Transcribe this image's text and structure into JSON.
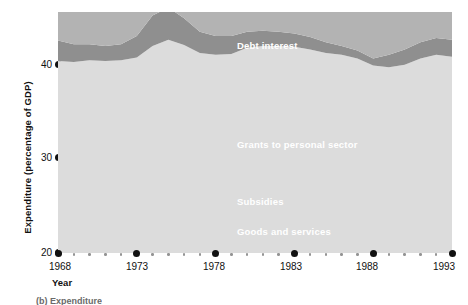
{
  "chart_data": {
    "type": "area",
    "title": "",
    "subtitle": "",
    "xlabel": "Year",
    "ylabel": "Expenditure (percentage of GDP)",
    "stacked": true,
    "grid": false,
    "legend_position": "inline-labels",
    "xlim": [
      1968,
      1993
    ],
    "ylim": [
      20,
      47
    ],
    "y_ticks": [
      20,
      30,
      40
    ],
    "x_ticks": [
      1968,
      1973,
      1978,
      1983,
      1988,
      1993
    ],
    "x": [
      1968,
      1969,
      1970,
      1971,
      1972,
      1973,
      1974,
      1975,
      1976,
      1977,
      1978,
      1979,
      1980,
      1981,
      1982,
      1983,
      1984,
      1985,
      1986,
      1987,
      1988,
      1989,
      1990,
      1991,
      1992,
      1993
    ],
    "series": [
      {
        "name": "Goods and services",
        "color": "#dcdcdc",
        "values": [
          21.5,
          21.4,
          21.6,
          21.5,
          21.6,
          21.9,
          23.2,
          23.9,
          23.3,
          22.4,
          22.2,
          22.3,
          23.0,
          23.2,
          23.2,
          23.1,
          22.8,
          22.4,
          22.2,
          21.8,
          21.0,
          20.8,
          21.1,
          21.8,
          22.2,
          22.0
        ]
      },
      {
        "name": "Subsidies",
        "color": "#8f8f8f",
        "values": [
          2.3,
          2.0,
          1.8,
          1.7,
          1.8,
          2.4,
          3.4,
          3.6,
          3.0,
          2.4,
          2.1,
          2.0,
          1.8,
          1.7,
          1.6,
          1.5,
          1.4,
          1.2,
          1.0,
          0.9,
          0.8,
          1.4,
          1.7,
          1.8,
          1.9,
          1.9
        ]
      },
      {
        "name": "Grants to personal sector",
        "color": "#b3b3b3",
        "values": [
          7.9,
          8.2,
          8.3,
          8.5,
          8.8,
          8.2,
          8.5,
          9.6,
          10.2,
          10.4,
          10.3,
          10.2,
          11.1,
          12.3,
          12.8,
          12.9,
          13.0,
          13.1,
          13.0,
          12.4,
          11.6,
          11.1,
          11.4,
          12.6,
          13.5,
          13.8
        ]
      },
      {
        "name": "Debt interest",
        "color": "#d3d3d3",
        "values": [
          3.6,
          3.6,
          3.7,
          3.6,
          3.5,
          3.6,
          4.0,
          4.4,
          4.6,
          4.4,
          4.3,
          4.4,
          4.5,
          4.8,
          4.9,
          4.7,
          4.6,
          4.4,
          4.1,
          3.7,
          3.3,
          3.1,
          3.1,
          3.2,
          3.3,
          3.4
        ]
      }
    ],
    "series_labels": [
      {
        "text": "Debt interest",
        "left": 237,
        "top": 40
      },
      {
        "text": "Grants to personal sector",
        "left": 237,
        "top": 139
      },
      {
        "text": "Subsidies",
        "left": 237,
        "top": 196
      },
      {
        "text": "Goods and services",
        "left": 237,
        "top": 226
      }
    ],
    "y_tick_labels": [
      {
        "value": "40",
        "top": 60
      },
      {
        "value": "30",
        "top": 153
      },
      {
        "value": "20",
        "top": 248
      }
    ],
    "x_tick_labels": [
      {
        "value": "1968",
        "left": 40
      },
      {
        "value": "1973",
        "left": 117
      },
      {
        "value": "1978",
        "left": 194
      },
      {
        "value": "1983",
        "left": 271
      },
      {
        "value": "1988",
        "left": 347
      },
      {
        "value": "1993",
        "left": 424
      }
    ],
    "caption": "(b) Expenditure",
    "colors": {
      "goods_and_services": "#dcdcdc",
      "subsidies": "#8f8f8f",
      "grants_to_personal_sector": "#b3b3b3",
      "debt_interest": "#d3d3d3",
      "axis": "#111111"
    }
  }
}
